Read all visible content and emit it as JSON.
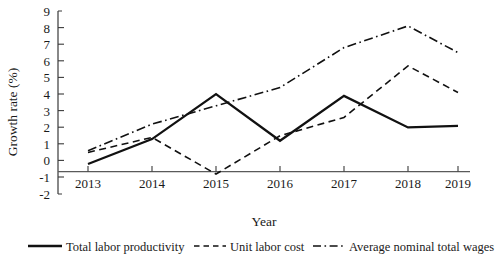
{
  "chart_data": {
    "type": "line",
    "title": "",
    "xlabel": "Year",
    "ylabel": "Growth rate (%)",
    "categories": [
      "2013",
      "2014",
      "2015",
      "2016",
      "2017",
      "2018",
      "2019"
    ],
    "x": [
      2013,
      2014,
      2015,
      2016,
      2017,
      2018,
      2019
    ],
    "ylim": [
      -2,
      9
    ],
    "ytick_labels": [
      "9",
      "8",
      "7",
      "6",
      "5",
      "4",
      "3",
      "2",
      "1",
      "0",
      "-1",
      "-2"
    ],
    "ytick_values": [
      9,
      8,
      7,
      6,
      5,
      4,
      3,
      2,
      1,
      0,
      -1,
      -2
    ],
    "ytick_step": 1,
    "grid": false,
    "legend_position": "bottom",
    "zero_line": true,
    "series": [
      {
        "name": "Total labor productivity",
        "style": "solid",
        "color": "#111111",
        "values": [
          -0.2,
          1.3,
          4.0,
          1.2,
          3.9,
          2.0,
          2.1
        ]
      },
      {
        "name": "Unit labor cost",
        "style": "dashed",
        "color": "#111111",
        "values": [
          0.5,
          1.4,
          -0.8,
          1.5,
          2.6,
          5.7,
          4.1
        ]
      },
      {
        "name": "Average nominal total wages",
        "style": "dash-dot",
        "color": "#111111",
        "values": [
          0.6,
          2.2,
          3.3,
          4.4,
          6.8,
          8.1,
          6.5
        ]
      }
    ]
  },
  "axes": {
    "y_title": "Growth rate (%)",
    "x_title": "Year"
  },
  "legend": {
    "items": [
      {
        "label": "Total labor productivity",
        "style": "solid"
      },
      {
        "label": "Unit labor cost",
        "style": "dashed"
      },
      {
        "label": "Average nominal total wages",
        "style": "dash-dot"
      }
    ]
  },
  "ticks": {
    "y": [
      "9",
      "8",
      "7",
      "6",
      "5",
      "4",
      "3",
      "2",
      "1",
      "0",
      "-1",
      "-2"
    ],
    "x": [
      "2013",
      "2014",
      "2015",
      "2016",
      "2017",
      "2018",
      "2019"
    ]
  }
}
